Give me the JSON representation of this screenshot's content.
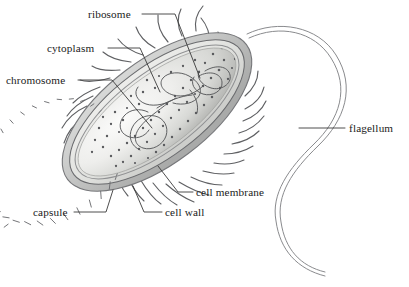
{
  "figure": {
    "background_color": "#ffffff",
    "line_color": "#3a3a3a"
  },
  "labels": [
    {
      "id": "ribosome",
      "text": "ribosome",
      "x": 88,
      "y": 18,
      "anchor": "start"
    },
    {
      "id": "cytoplasm",
      "text": "cytoplasm",
      "x": 47,
      "y": 52,
      "anchor": "start"
    },
    {
      "id": "chromosome",
      "text": "chromosome",
      "x": 6,
      "y": 84,
      "anchor": "start"
    },
    {
      "id": "flagellum",
      "text": "flagellum",
      "x": 349,
      "y": 132,
      "anchor": "start"
    },
    {
      "id": "cell-membrane",
      "text": "cell membrane",
      "x": 196,
      "y": 196,
      "anchor": "start"
    },
    {
      "id": "cell-wall",
      "text": "cell wall",
      "x": 165,
      "y": 216,
      "anchor": "start"
    },
    {
      "id": "capsule",
      "text": "capsule",
      "x": 33,
      "y": 216,
      "anchor": "start"
    }
  ],
  "leader_lines": [
    {
      "id": "ribosome-leader",
      "d": "M 142 14 L 175 14 L 200 78"
    },
    {
      "id": "cytoplasm-leader",
      "d": "M 108 48 L 140 48 L 160 92"
    },
    {
      "id": "chromosome-leader",
      "d": "M 78 80 L 112 80 L 152 128"
    },
    {
      "id": "flagellum-leader",
      "d": "M 299 128 L 345 128"
    },
    {
      "id": "cell-membrane-leader",
      "d": "M 193 192 L 178 192 L 158 166"
    },
    {
      "id": "cell-wall-leader",
      "d": "M 162 212 L 144 212 L 133 186"
    },
    {
      "id": "capsule-leader",
      "d": "M 74 212 L 106 212 L 113 190"
    }
  ],
  "colors": {
    "capsule_fill": "#cfd0cf",
    "capsule_edge": "#7d7e80",
    "wall_fill": "#e4e5e3",
    "wall_edge": "#6a6b6e",
    "membrane_edge": "#8f9092",
    "cytoplasm_light": "#f2f2f0",
    "cytoplasm_mid": "#dcdcd9",
    "cytoplasm_dark": "#b9bab7",
    "ribosome_dot": "#5a5b5e",
    "chromosome_stroke": "#57585b",
    "flagellum_stroke": "#8a8b8e",
    "text": "#1a1a1a"
  },
  "cell_geometry": {
    "center_x": 157,
    "center_y": 112,
    "rotation_deg": -37,
    "capsule_rx": 112,
    "capsule_ry": 52,
    "wall_rx": 104,
    "wall_ry": 45,
    "membrane_rx": 98,
    "membrane_ry": 39,
    "cytoplasm_rx": 95,
    "cytoplasm_ry": 36
  },
  "structures": [
    {
      "name": "capsule",
      "description": "outer gray band enclosing the cell"
    },
    {
      "name": "pili",
      "description": "hair-like projections radiating from the capsule",
      "count": 34
    },
    {
      "name": "cell wall",
      "description": "segmented band divided by radial tick marks",
      "segments": 34
    },
    {
      "name": "cell membrane",
      "description": "thin line just inside the cell wall"
    },
    {
      "name": "cytoplasm",
      "description": "shaded interior with gradient"
    },
    {
      "name": "ribosomes",
      "description": "small dark dots scattered in the cytoplasm",
      "count": 86
    },
    {
      "name": "chromosome",
      "description": "tangled continuous loop of DNA in the cytoplasm"
    },
    {
      "name": "flagellum",
      "description": "long double-lined whip extending from the upper-right pole"
    }
  ]
}
